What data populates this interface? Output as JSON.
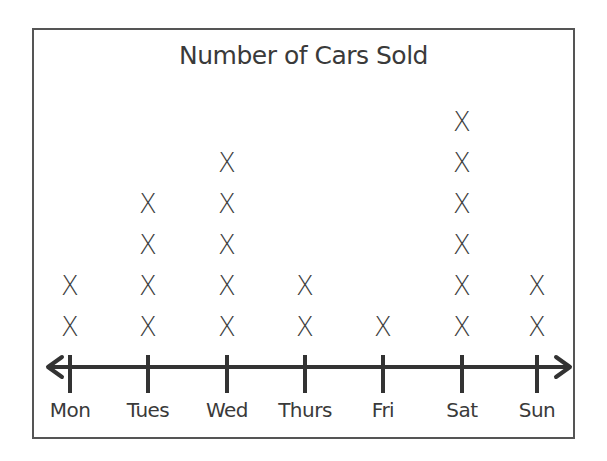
{
  "chart_data": {
    "type": "dot-plot",
    "title": "Number of Cars Sold",
    "categories": [
      "Mon",
      "Tues",
      "Wed",
      "Thurs",
      "Fri",
      "Sat",
      "Sun"
    ],
    "values": [
      2,
      4,
      5,
      2,
      1,
      6,
      2
    ],
    "marker": "X",
    "xlabel": "",
    "ylabel": "",
    "grid": false,
    "legend": null
  },
  "colors": {
    "ink": "#3a3a3a",
    "border": "#555555",
    "background": "#ffffff"
  }
}
